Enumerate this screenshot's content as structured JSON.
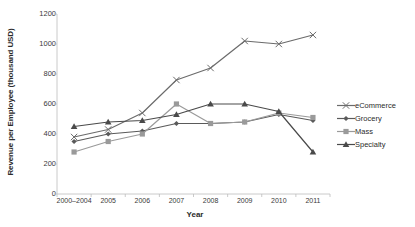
{
  "chart_data": {
    "type": "line",
    "title": "",
    "xlabel": "Year",
    "ylabel": "Revenue per Employee (thousand USD)",
    "categories": [
      "2000–2004",
      "2005",
      "2006",
      "2007",
      "2008",
      "2009",
      "2010",
      "2011"
    ],
    "ylim": [
      0,
      1200
    ],
    "yticks": [
      0,
      200,
      400,
      600,
      800,
      1000,
      1200
    ],
    "ytick_labels": [
      "0",
      "200",
      "400",
      "600",
      "800",
      "1000",
      "1200"
    ],
    "grid": false,
    "legend_position": "right",
    "series": [
      {
        "name": "eCommerce",
        "color": "#6b6b6b",
        "marker": "x",
        "values": [
          380,
          430,
          540,
          760,
          840,
          1020,
          1000,
          1060
        ]
      },
      {
        "name": "Grocery",
        "color": "#5a5a5a",
        "marker": "diamond",
        "values": [
          350,
          400,
          420,
          470,
          470,
          480,
          530,
          490
        ]
      },
      {
        "name": "Mass",
        "color": "#9a9a9a",
        "marker": "square",
        "values": [
          280,
          350,
          400,
          600,
          470,
          480,
          540,
          510
        ]
      },
      {
        "name": "Specialty",
        "color": "#4a4a4a",
        "marker": "triangle",
        "values": [
          450,
          480,
          490,
          530,
          600,
          600,
          550,
          280
        ]
      }
    ]
  },
  "legend": {
    "items": [
      {
        "label": "eCommerce"
      },
      {
        "label": "Grocery"
      },
      {
        "label": "Mass"
      },
      {
        "label": "Specialty"
      }
    ]
  },
  "axes": {
    "x_title": "Year",
    "y_title": "Revenue per Employee (thousand USD)"
  }
}
